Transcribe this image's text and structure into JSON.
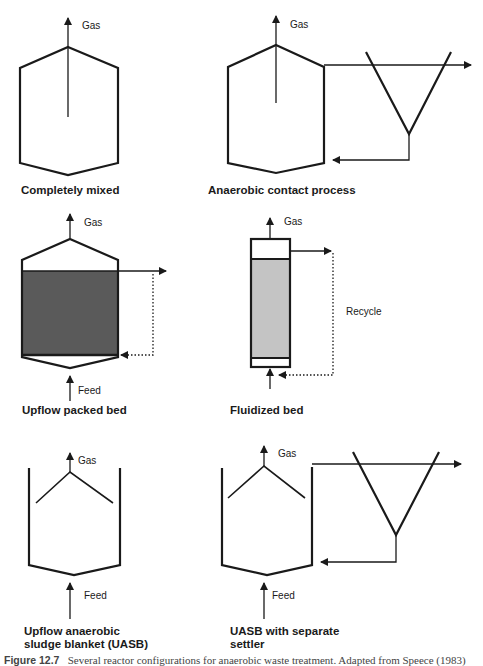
{
  "figure": {
    "caption_number": "Figure 12.7",
    "caption_text": "Several reactor configurations for anaerobic waste treatment. Adapted from Speece (1983)",
    "colors": {
      "line": "#1a1a1a",
      "packed_bed_fill": "#5a5a5a",
      "fluidized_bed_fill": "#c4c4c4",
      "background": "#ffffff"
    }
  },
  "panels": [
    {
      "id": "completely-mixed",
      "title": "Completely mixed",
      "gas_label": "Gas"
    },
    {
      "id": "anaerobic-contact",
      "title": "Anaerobic contact process",
      "gas_label": "Gas"
    },
    {
      "id": "upflow-packed-bed",
      "title": "Upflow packed bed",
      "gas_label": "Gas",
      "feed_label": "Feed"
    },
    {
      "id": "fluidized-bed",
      "title": "Fluidized bed",
      "gas_label": "Gas",
      "recycle_label": "Recycle"
    },
    {
      "id": "uasb",
      "title_line1": "Upflow  anaerobic",
      "title_line2": "sludge blanket (UASB)",
      "gas_label": "Gas",
      "feed_label": "Feed"
    },
    {
      "id": "uasb-settler",
      "title_line1": "UASB with separate",
      "title_line2": "settler",
      "gas_label": "Gas",
      "feed_label": "Feed"
    }
  ]
}
